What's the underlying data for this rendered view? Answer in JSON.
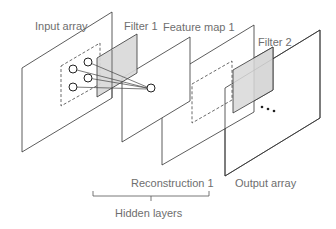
{
  "diagram": {
    "labels": {
      "input_array": "Input array",
      "filter_1": "Filter 1",
      "feature_map_1": "Feature map 1",
      "filter_2": "Filter 2",
      "reconstruction_1": "Reconstruction 1",
      "output_array": "Output array",
      "hidden_layers": "Hidden layers",
      "ellipsis": "..."
    },
    "colors": {
      "plane_stroke": "#333333",
      "filter_fill": "#d8d8d8",
      "label_text": "#6e6e6e",
      "background": "#ffffff"
    },
    "input_neurons": 4,
    "output_neurons": 1
  }
}
